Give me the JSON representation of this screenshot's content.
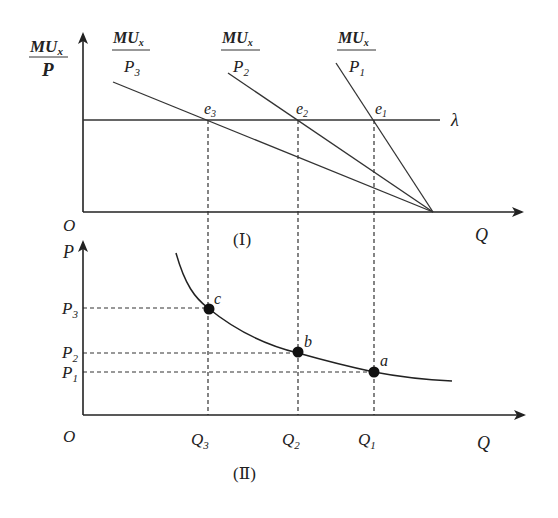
{
  "panel_top": {
    "caption": "(Ⅰ)",
    "y_axis_label_num": "MU",
    "y_axis_label_sub": "x",
    "y_axis_label_den": "P",
    "origin": "O",
    "x_axis_label": "Q",
    "lambda_label": "λ",
    "curves": [
      {
        "num": "MU",
        "num_sub": "x",
        "den": "P",
        "den_sub": "3"
      },
      {
        "num": "MU",
        "num_sub": "x",
        "den": "P",
        "den_sub": "2"
      },
      {
        "num": "MU",
        "num_sub": "x",
        "den": "P",
        "den_sub": "1"
      }
    ],
    "points": [
      {
        "name": "e",
        "sub": "3"
      },
      {
        "name": "e",
        "sub": "2"
      },
      {
        "name": "e",
        "sub": "1"
      }
    ]
  },
  "panel_bottom": {
    "caption": "(Ⅱ)",
    "y_axis_label": "P",
    "origin": "O",
    "x_axis_label": "Q",
    "y_ticks": [
      {
        "name": "P",
        "sub": "3"
      },
      {
        "name": "P",
        "sub": "2"
      },
      {
        "name": "P",
        "sub": "1"
      }
    ],
    "x_ticks": [
      {
        "name": "Q",
        "sub": "3"
      },
      {
        "name": "Q",
        "sub": "2"
      },
      {
        "name": "Q",
        "sub": "1"
      }
    ],
    "points": [
      {
        "label": "c"
      },
      {
        "label": "b"
      },
      {
        "label": "a"
      }
    ]
  }
}
